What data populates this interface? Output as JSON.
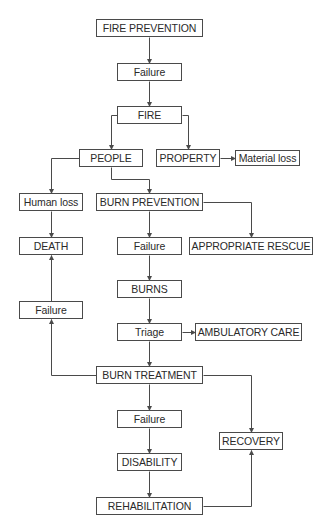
{
  "diagram": {
    "type": "flowchart",
    "line_color": "#4a4a4a",
    "box_border_color": "#4a4a4a",
    "text_color": "#2a2a2a",
    "background": "#ffffff",
    "nodes": [
      {
        "id": "fire_prevention",
        "label": "FIRE PREVENTION",
        "x": 96,
        "y": 19,
        "w": 107,
        "h": 18
      },
      {
        "id": "failure_1",
        "label": "Failure",
        "x": 117,
        "y": 63,
        "w": 65,
        "h": 18
      },
      {
        "id": "fire",
        "label": "FIRE",
        "x": 117,
        "y": 106,
        "w": 65,
        "h": 18
      },
      {
        "id": "people",
        "label": "PEOPLE",
        "x": 79,
        "y": 149,
        "w": 64,
        "h": 18
      },
      {
        "id": "property",
        "label": "PROPERTY",
        "x": 156,
        "y": 149,
        "w": 64,
        "h": 18
      },
      {
        "id": "material_loss",
        "label": "Material loss",
        "x": 235,
        "y": 150,
        "w": 65,
        "h": 16
      },
      {
        "id": "human_loss",
        "label": "Human loss",
        "x": 19,
        "y": 193,
        "w": 64,
        "h": 18
      },
      {
        "id": "burn_prevention",
        "label": "BURN PREVENTION",
        "x": 96,
        "y": 193,
        "w": 107,
        "h": 18
      },
      {
        "id": "death",
        "label": "DEATH",
        "x": 19,
        "y": 237,
        "w": 64,
        "h": 18
      },
      {
        "id": "failure_2",
        "label": "Failure",
        "x": 117,
        "y": 237,
        "w": 65,
        "h": 18
      },
      {
        "id": "appropriate_rescue",
        "label": "APPROPRIATE RESCUE",
        "x": 189,
        "y": 237,
        "w": 124,
        "h": 18
      },
      {
        "id": "failure_left",
        "label": "Failure",
        "x": 19,
        "y": 301,
        "w": 64,
        "h": 18
      },
      {
        "id": "burns",
        "label": "BURNS",
        "x": 117,
        "y": 280,
        "w": 65,
        "h": 18
      },
      {
        "id": "triage",
        "label": "Triage",
        "x": 117,
        "y": 323,
        "w": 65,
        "h": 18
      },
      {
        "id": "ambulatory_care",
        "label": "AMBULATORY CARE",
        "x": 195,
        "y": 323,
        "w": 107,
        "h": 18
      },
      {
        "id": "burn_treatment",
        "label": "BURN TREATMENT",
        "x": 96,
        "y": 366,
        "w": 107,
        "h": 18
      },
      {
        "id": "failure_3",
        "label": "Failure",
        "x": 117,
        "y": 410,
        "w": 65,
        "h": 18
      },
      {
        "id": "recovery",
        "label": "RECOVERY",
        "x": 219,
        "y": 432,
        "w": 64,
        "h": 18
      },
      {
        "id": "disability",
        "label": "DISABILITY",
        "x": 117,
        "y": 453,
        "w": 65,
        "h": 18
      },
      {
        "id": "rehabilitation",
        "label": "REHABILITATION",
        "x": 96,
        "y": 497,
        "w": 107,
        "h": 18
      }
    ],
    "edges": [
      {
        "from": "fire_prevention",
        "to": "failure_1",
        "path": [
          [
            149,
            37
          ],
          [
            149,
            63
          ]
        ]
      },
      {
        "from": "failure_1",
        "to": "fire",
        "path": [
          [
            149,
            81
          ],
          [
            149,
            106
          ]
        ]
      },
      {
        "from": "fire",
        "to": "people",
        "path": [
          [
            117,
            115
          ],
          [
            111,
            115
          ],
          [
            111,
            149
          ]
        ]
      },
      {
        "from": "fire",
        "to": "property",
        "path": [
          [
            182,
            115
          ],
          [
            188,
            115
          ],
          [
            188,
            149
          ]
        ]
      },
      {
        "from": "property",
        "to": "material_loss",
        "path": [
          [
            220,
            158
          ],
          [
            235,
            158
          ]
        ]
      },
      {
        "from": "people",
        "to": "human_loss",
        "path": [
          [
            79,
            158
          ],
          [
            51,
            158
          ],
          [
            51,
            193
          ]
        ]
      },
      {
        "from": "people",
        "to": "burn_prevention",
        "path": [
          [
            111,
            167
          ],
          [
            111,
            179
          ],
          [
            149,
            179
          ],
          [
            149,
            193
          ]
        ]
      },
      {
        "from": "human_loss",
        "to": "death",
        "path": [
          [
            51,
            211
          ],
          [
            51,
            237
          ]
        ]
      },
      {
        "from": "burn_prevention",
        "to": "failure_2",
        "path": [
          [
            149,
            211
          ],
          [
            149,
            237
          ]
        ]
      },
      {
        "from": "burn_prevention",
        "to": "appropriate_rescue",
        "path": [
          [
            203,
            202
          ],
          [
            251,
            202
          ],
          [
            251,
            237
          ]
        ]
      },
      {
        "from": "failure_2",
        "to": "burns",
        "path": [
          [
            149,
            255
          ],
          [
            149,
            280
          ]
        ]
      },
      {
        "from": "burns",
        "to": "triage",
        "path": [
          [
            149,
            298
          ],
          [
            149,
            323
          ]
        ]
      },
      {
        "from": "triage",
        "to": "ambulatory_care",
        "path": [
          [
            182,
            332
          ],
          [
            195,
            332
          ]
        ]
      },
      {
        "from": "triage",
        "to": "burn_treatment",
        "path": [
          [
            149,
            341
          ],
          [
            149,
            366
          ]
        ]
      },
      {
        "from": "burn_treatment",
        "to": "failure_left",
        "path": [
          [
            96,
            375
          ],
          [
            51,
            375
          ],
          [
            51,
            319
          ]
        ]
      },
      {
        "from": "failure_left",
        "to": "death",
        "path": [
          [
            51,
            301
          ],
          [
            51,
            255
          ]
        ]
      },
      {
        "from": "burn_treatment",
        "to": "failure_3",
        "path": [
          [
            149,
            384
          ],
          [
            149,
            410
          ]
        ]
      },
      {
        "from": "burn_treatment",
        "to": "recovery",
        "path": [
          [
            203,
            375
          ],
          [
            251,
            375
          ],
          [
            251,
            432
          ]
        ]
      },
      {
        "from": "failure_3",
        "to": "disability",
        "path": [
          [
            149,
            428
          ],
          [
            149,
            453
          ]
        ]
      },
      {
        "from": "disability",
        "to": "rehabilitation",
        "path": [
          [
            149,
            471
          ],
          [
            149,
            497
          ]
        ]
      },
      {
        "from": "rehabilitation",
        "to": "recovery",
        "path": [
          [
            203,
            506
          ],
          [
            251,
            506
          ],
          [
            251,
            450
          ]
        ]
      }
    ]
  }
}
